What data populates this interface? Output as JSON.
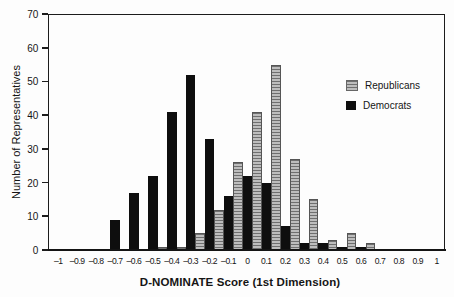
{
  "figure": {
    "type": "scanned-statistical-figure",
    "background_color": "#fdfdfd",
    "axis_color": "#1c1c1c"
  },
  "chart_data": {
    "type": "bar",
    "subtype": "paired-histogram",
    "title": "",
    "xlabel": "D-NOMINATE Score (1st Dimension)",
    "ylabel": "Number of Representatives",
    "xlim": [
      -1,
      1
    ],
    "ylim": [
      0,
      70
    ],
    "ytick_step": 10,
    "ytick_labels": [
      "0",
      "10",
      "20",
      "30",
      "40",
      "50",
      "60",
      "70"
    ],
    "grid": false,
    "legend_position": "upper-right-inside",
    "categories": [
      "-1",
      "-0.9",
      "-0.8",
      "-0.7",
      "-0.6",
      "-0.5",
      "-0.4",
      "-0.3",
      "-0.2",
      "-0.1",
      "0",
      "0.1",
      "0.2",
      "0.3",
      "0.4",
      "0.5",
      "0.6",
      "0.7",
      "0.8",
      "0.9",
      "1"
    ],
    "bin_centers": [
      -1,
      -0.9,
      -0.8,
      -0.7,
      -0.6,
      -0.5,
      -0.4,
      -0.3,
      -0.2,
      -0.1,
      0,
      0.1,
      0.2,
      0.3,
      0.4,
      0.5,
      0.6,
      0.7,
      0.8,
      0.9,
      1
    ],
    "series": [
      {
        "name": "Republicans",
        "style": "gray-horizontal-stripes",
        "color": "#bdbdbd",
        "stripe_color": "#6f6f6f",
        "values": [
          0,
          0,
          0,
          0,
          0,
          1,
          1,
          5,
          12,
          26,
          41,
          55,
          27,
          15,
          3,
          5,
          2,
          0,
          0,
          0,
          0
        ]
      },
      {
        "name": "Democrats",
        "style": "solid-black",
        "color": "#0e0e0e",
        "stripe_color": null,
        "values": [
          0,
          0,
          0,
          9,
          17,
          22,
          41,
          52,
          33,
          16,
          22,
          20,
          7,
          2,
          2,
          1,
          1,
          0,
          0,
          0,
          0
        ]
      }
    ]
  }
}
